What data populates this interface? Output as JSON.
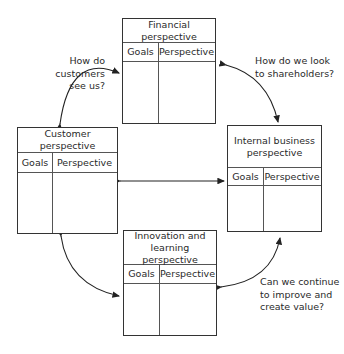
{
  "boxes": {
    "financial": {
      "title": "Financial perspective",
      "goals": "Goals",
      "perspective": "Perspective"
    },
    "customer": {
      "title": "Customer perspective",
      "goals": "Goals",
      "perspective": "Perspective"
    },
    "internal": {
      "title": "Internal business\nperspective",
      "goals": "Goals",
      "perspective": "Perspective"
    },
    "innovation": {
      "title": "Innovation and\nlearning perspective",
      "goals": "Goals",
      "perspective": "Perspective"
    }
  },
  "questions": {
    "customers": "How do customers\nsee us?",
    "shareholders": "How do we look\nto shareholders?",
    "improve": "Can we continue\nto improve and\ncreate value?"
  }
}
